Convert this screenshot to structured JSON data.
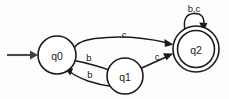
{
  "diagram": {
    "type": "state-machine",
    "background_color": "#fdfdfd",
    "stroke_color": "#1b1b1b",
    "start_arrow_color": "#4a4a4a",
    "states": [
      {
        "id": "q0",
        "label": "q0",
        "cx": 57,
        "cy": 55,
        "r": 19,
        "accepting": false,
        "initial": true
      },
      {
        "id": "q1",
        "label": "q1",
        "cx": 125,
        "cy": 76,
        "r": 18,
        "accepting": false,
        "initial": false
      },
      {
        "id": "q2",
        "label": "q2",
        "cx": 196,
        "cy": 49,
        "r": 23,
        "r_inner": 18.5,
        "accepting": true,
        "initial": false
      }
    ],
    "transitions": [
      {
        "id": "q0-q2",
        "from": "q0",
        "to": "q2",
        "label": "c",
        "label_x": 124,
        "label_y": 34
      },
      {
        "id": "q0-q1",
        "from": "q0",
        "to": "q1",
        "label": "b",
        "label_x": 89,
        "label_y": 57
      },
      {
        "id": "q1-q0",
        "from": "q1",
        "to": "q0",
        "label": "b",
        "label_x": 90,
        "label_y": 74
      },
      {
        "id": "q1-q2",
        "from": "q1",
        "to": "q2",
        "label": "c",
        "label_x": 157,
        "label_y": 56
      },
      {
        "id": "q2-q2",
        "from": "q2",
        "to": "q2",
        "label": "b,c",
        "label_x": 194,
        "label_y": 8,
        "self_loop": true
      }
    ],
    "start_arrow": {
      "id": "start-arrow",
      "x1": 7,
      "y1": 55,
      "x2": 37,
      "y2": 55
    }
  }
}
